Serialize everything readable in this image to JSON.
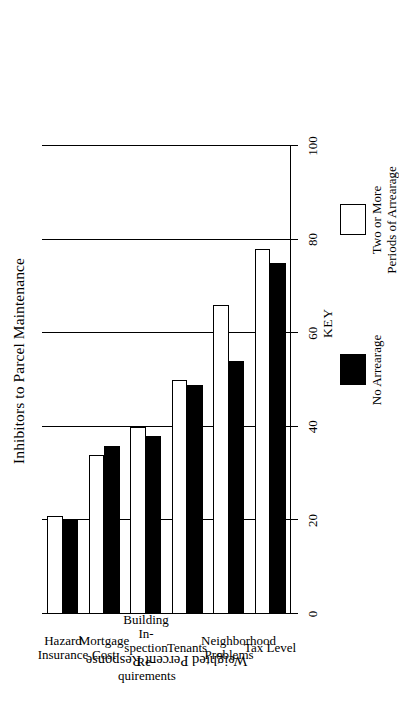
{
  "chart_data": {
    "type": "bar",
    "orientation": "vertical",
    "rotated_page": true,
    "title": "Inhibitors to Parcel Maintenance",
    "xlabel": "",
    "ylabel": "Weighted Percent Response",
    "ylim": [
      0,
      100
    ],
    "yticks": [
      0,
      20,
      40,
      60,
      80,
      100
    ],
    "ytick_labels": [
      "0",
      "20",
      "40",
      "60",
      "80",
      "100"
    ],
    "grid": true,
    "grid_axis": "y",
    "legend_position": "below-plot",
    "categories": [
      "Tax Level",
      "Neighborhood\nProblems",
      "Tenants",
      "Building In-\nspection Re-\nquirements",
      "Mortgage\nCost",
      "Hazard\nInsurance"
    ],
    "series": [
      {
        "name": "Two or More\nPeriods of Arrearage",
        "color": "#ffffff",
        "edge_color": "#000000",
        "values": [
          78,
          66,
          50,
          40,
          34,
          21
        ]
      },
      {
        "name": "No Arrearage",
        "color": "#000000",
        "edge_color": "#000000",
        "values": [
          75,
          54,
          49,
          38,
          36,
          20
        ]
      }
    ]
  },
  "legend": {
    "title": "KEY",
    "entries": [
      {
        "label": "No Arrearage",
        "swatch": "black"
      },
      {
        "label": "Two or More\nPeriods of Arrearage",
        "swatch": "white"
      }
    ]
  },
  "axis": {
    "value_axis_title": "Weighted Percent Response",
    "tick_labels": [
      "0",
      "20",
      "40",
      "60",
      "80",
      "100"
    ]
  }
}
